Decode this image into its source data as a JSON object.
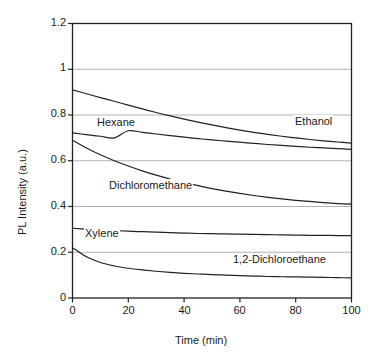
{
  "chart_data": {
    "type": "line",
    "title": "",
    "xlabel": "Time (min)",
    "ylabel": "PL Intensity (a.u.)",
    "xlim": [
      0,
      100
    ],
    "ylim": [
      0,
      1.2
    ],
    "xticks": [
      "0",
      "20",
      "40",
      "60",
      "80",
      "100"
    ],
    "xtick_values": [
      0,
      20,
      40,
      60,
      80,
      100
    ],
    "yticks": [
      "0",
      "0.2",
      "0.4",
      "0.6",
      "0.8",
      "1",
      "1.2"
    ],
    "ytick_values": [
      0,
      0.2,
      0.4,
      0.6,
      0.8,
      1,
      1.2
    ],
    "grid": "horizontal",
    "legend_position": "inline-labels",
    "line_color": "#222222",
    "grid_color": "#b3b3b3",
    "frame_color": "#222222",
    "x": [
      0,
      5,
      10,
      15,
      20,
      25,
      30,
      35,
      40,
      45,
      50,
      55,
      60,
      65,
      70,
      75,
      80,
      85,
      90,
      95,
      100
    ],
    "series": [
      {
        "name": "Ethanol",
        "label": "Ethanol",
        "values": [
          0.91,
          0.893,
          0.876,
          0.86,
          0.843,
          0.827,
          0.811,
          0.796,
          0.782,
          0.769,
          0.757,
          0.745,
          0.734,
          0.724,
          0.715,
          0.707,
          0.7,
          0.693,
          0.687,
          0.682,
          0.677
        ]
      },
      {
        "name": "Hexane",
        "label": "Hexane",
        "values": [
          0.722,
          0.714,
          0.707,
          0.7,
          0.731,
          0.724,
          0.717,
          0.71,
          0.703,
          0.697,
          0.691,
          0.686,
          0.681,
          0.676,
          0.671,
          0.667,
          0.663,
          0.659,
          0.656,
          0.653,
          0.65
        ]
      },
      {
        "name": "Dichloromethane",
        "label": "Dichloromethane",
        "values": [
          0.69,
          0.656,
          0.626,
          0.6,
          0.577,
          0.556,
          0.537,
          0.52,
          0.505,
          0.491,
          0.478,
          0.467,
          0.457,
          0.448,
          0.44,
          0.433,
          0.427,
          0.422,
          0.417,
          0.413,
          0.41
        ]
      },
      {
        "name": "Xylene",
        "label": "Xylene",
        "values": [
          0.305,
          0.301,
          0.298,
          0.295,
          0.292,
          0.29,
          0.288,
          0.286,
          0.284,
          0.282,
          0.281,
          0.28,
          0.279,
          0.278,
          0.277,
          0.276,
          0.275,
          0.274,
          0.274,
          0.273,
          0.273
        ]
      },
      {
        "name": "1,2-Dichloroethane",
        "label": "1,2-Dichloroethane",
        "values": [
          0.22,
          0.18,
          0.155,
          0.14,
          0.13,
          0.123,
          0.117,
          0.112,
          0.108,
          0.105,
          0.102,
          0.1,
          0.098,
          0.096,
          0.094,
          0.093,
          0.092,
          0.091,
          0.09,
          0.089,
          0.088
        ]
      }
    ],
    "series_label_positions": [
      {
        "name": "Ethanol",
        "x_px": 294,
        "y_px": 120
      },
      {
        "name": "Hexane",
        "x_px": 96,
        "y_px": 121
      },
      {
        "name": "Dichloromethane",
        "x_px": 108,
        "y_px": 184
      },
      {
        "name": "Xylene",
        "x_px": 84,
        "y_px": 232
      },
      {
        "name": "1,2-Dichloroethane",
        "x_px": 232,
        "y_px": 258
      }
    ]
  }
}
